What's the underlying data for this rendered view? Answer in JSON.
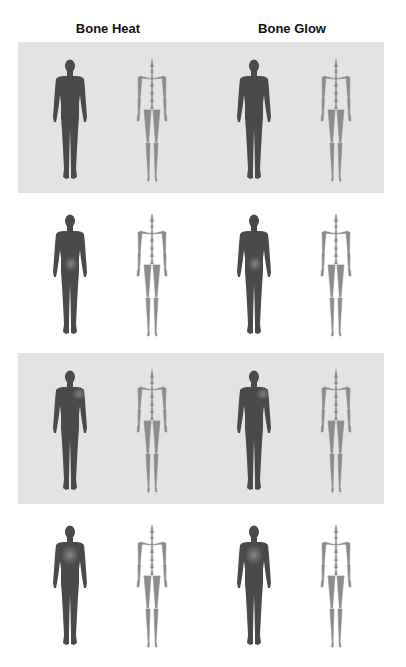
{
  "figure": {
    "columns": [
      {
        "title": "Bone Heat"
      },
      {
        "title": "Bone Glow"
      }
    ],
    "rows": [
      {
        "shaded": true,
        "top": 42,
        "heat": {
          "left": "none",
          "right": "none"
        }
      },
      {
        "shaded": false,
        "top": 197,
        "heat": {
          "left": "hip",
          "right": "hip"
        }
      },
      {
        "shaded": true,
        "top": 353,
        "heat": {
          "left": "shoulder",
          "right": "shoulder"
        }
      },
      {
        "shaded": false,
        "top": 508,
        "heat": {
          "left": "torso",
          "right": "torso"
        }
      }
    ],
    "colors": {
      "band": "#e3e3e3",
      "body": "#4a4a4a",
      "skeleton": "#8c8c8c",
      "heat": "#7a7a7a"
    }
  }
}
